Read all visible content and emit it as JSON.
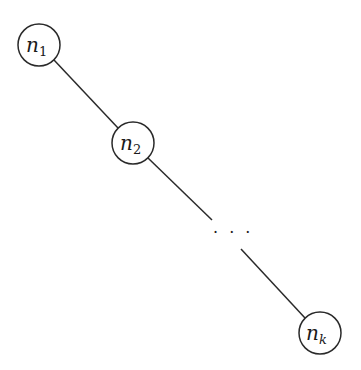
{
  "diagram": {
    "type": "path-graph",
    "nodes": [
      {
        "id": "n1",
        "base": "n",
        "sub": "1",
        "cx": 39,
        "cy": 45,
        "r": 21
      },
      {
        "id": "n2",
        "base": "n",
        "sub": "2",
        "cx": 133,
        "cy": 143,
        "r": 21
      },
      {
        "id": "nk",
        "base": "n",
        "sub": "k",
        "cx": 320,
        "cy": 333,
        "r": 21
      }
    ],
    "edges": [
      {
        "from": "n1",
        "to": "n2"
      },
      {
        "from": "n2",
        "to": "ellipsis"
      },
      {
        "from": "ellipsis",
        "to": "nk"
      }
    ],
    "ellipsis": "· · ·"
  }
}
